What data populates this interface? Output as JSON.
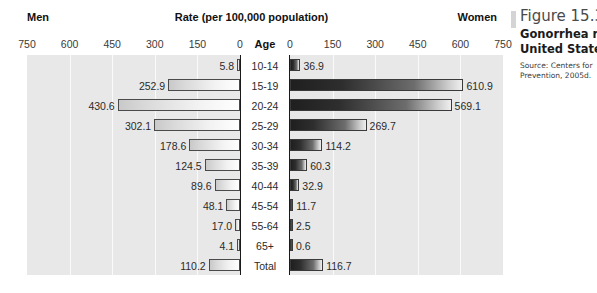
{
  "header": {
    "men_label": "Men",
    "title": "Rate (per 100,000 population)",
    "women_label": "Women",
    "age_label": "Age"
  },
  "axis": {
    "left_ticks": [
      "750",
      "600",
      "450",
      "300",
      "150",
      "0"
    ],
    "right_ticks": [
      "0",
      "150",
      "300",
      "450",
      "600",
      "750"
    ]
  },
  "caption": {
    "figure_number": "Figure 15.3",
    "line1": "Gonorrhea ra",
    "line2": "United States",
    "source1": "Source: Centers for",
    "source2": "Prevention, 2005d."
  },
  "chart_data": {
    "type": "bar",
    "title": "Rate (per 100,000 population)",
    "subtype": "population-pyramid",
    "xlabel": "Rate (per 100,000 population)",
    "ylabel": "Age",
    "xlim": [
      0,
      750
    ],
    "grid": true,
    "legend_position": "top",
    "categories": [
      "10-14",
      "15-19",
      "20-24",
      "25-29",
      "30-34",
      "35-39",
      "40-44",
      "45-54",
      "55-64",
      "65+",
      "Total"
    ],
    "series": [
      {
        "name": "Men",
        "side": "left",
        "values": [
          5.8,
          252.9,
          430.6,
          302.1,
          178.6,
          124.5,
          89.6,
          48.1,
          17.0,
          4.1,
          110.2
        ]
      },
      {
        "name": "Women",
        "side": "right",
        "values": [
          36.9,
          610.9,
          569.1,
          269.7,
          114.2,
          60.3,
          32.9,
          11.7,
          2.5,
          0.6,
          116.7
        ]
      }
    ],
    "rows": [
      {
        "age": "10-14",
        "men": "5.8",
        "women": "36.9"
      },
      {
        "age": "15-19",
        "men": "252.9",
        "women": "610.9"
      },
      {
        "age": "20-24",
        "men": "430.6",
        "women": "569.1"
      },
      {
        "age": "25-29",
        "men": "302.1",
        "women": "269.7"
      },
      {
        "age": "30-34",
        "men": "178.6",
        "women": "114.2"
      },
      {
        "age": "35-39",
        "men": "124.5",
        "women": "60.3"
      },
      {
        "age": "40-44",
        "men": "89.6",
        "women": "32.9"
      },
      {
        "age": "45-54",
        "men": "48.1",
        "women": "11.7"
      },
      {
        "age": "55-64",
        "men": "17.0",
        "women": "2.5"
      },
      {
        "age": "65+",
        "men": "4.1",
        "women": "0.6"
      },
      {
        "age": "Total",
        "men": "110.2",
        "women": "116.7"
      }
    ],
    "colors": {
      "men_bar": "#eeeeee",
      "women_bar": "#2b2b2b",
      "panel_background": "#e8e8e8",
      "gridline": "#fafafa",
      "text": "#2b2b2b"
    }
  }
}
